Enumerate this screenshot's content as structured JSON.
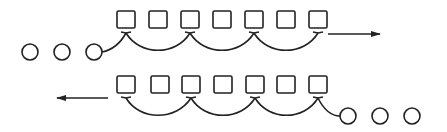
{
  "diagram": {
    "stroke_color": "#222222",
    "background": "#ffffff",
    "rows": [
      {
        "name": "top-row",
        "box_count": 7,
        "input_circles": 3,
        "input_side": "left",
        "output_arrow_direction": "right",
        "arc_targets": [
          0,
          2,
          4,
          6
        ]
      },
      {
        "name": "bottom-row",
        "box_count": 7,
        "input_circles": 3,
        "input_side": "right",
        "output_arrow_direction": "left",
        "arc_targets": [
          6,
          4,
          2,
          0
        ]
      }
    ]
  }
}
